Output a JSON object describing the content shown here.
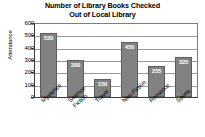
{
  "chart_data": {
    "type": "bar",
    "title": "Number of Library Books Checked Out of Local Library",
    "title_lines": [
      "Number of Library Books Checked",
      "Out of Local Library"
    ],
    "xlabel": "",
    "ylabel": "Attendance",
    "categories": [
      "Mysteries",
      "Science Fiction",
      "Travel",
      "Non-Fiction",
      "Romance",
      "Sports"
    ],
    "category_lines": [
      [
        "Mysteries"
      ],
      [
        "Science",
        "Fiction"
      ],
      [
        "Travel"
      ],
      [
        "Non-Fiction"
      ],
      [
        "Romance"
      ],
      [
        "Sports"
      ]
    ],
    "values": [
      520,
      300,
      150,
      450,
      255,
      325
    ],
    "value_labels": [
      "520",
      "300",
      "150",
      "450",
      "255",
      "325"
    ],
    "ylim": [
      0,
      600
    ],
    "yticks": [
      0,
      100,
      200,
      300,
      400,
      500,
      600
    ],
    "ytick_labels": [
      "0",
      "100",
      "200",
      "300",
      "400",
      "500",
      "600"
    ],
    "grid": true,
    "legend": false,
    "bar_color": "#828282",
    "bar_border_color": "#5d5d5d",
    "value_label_color": "#ffffff",
    "axis_color": "#3a3a3a",
    "gridline_color": "#9a9a9a",
    "background_color": "#ffffff"
  }
}
